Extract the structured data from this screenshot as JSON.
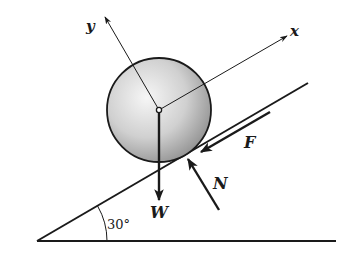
{
  "diagram": {
    "type": "free-body-diagram",
    "labels": {
      "y_axis": "y",
      "x_axis": "x",
      "friction": "F",
      "normal": "N",
      "weight": "W",
      "angle": "30°"
    },
    "incline_angle_deg": 30,
    "colors": {
      "line": "#1a1a1a",
      "ball_light": "#f4f4f4",
      "ball_dark": "#9a9a9a"
    }
  }
}
